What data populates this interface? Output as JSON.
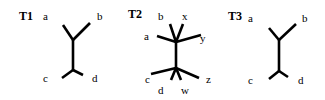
{
  "diagram": {
    "type": "phylogenetic-trees",
    "trees": [
      {
        "id": "T1",
        "title": "T1",
        "leaves": {
          "a": "a",
          "b": "b",
          "c": "c",
          "d": "d"
        },
        "topology": "((a,b),(c,d))"
      },
      {
        "id": "T2",
        "title": "T2",
        "leaves": {
          "a": "a",
          "b": "b",
          "x": "x",
          "y": "y",
          "c": "c",
          "d": "d",
          "w": "w",
          "z": "z"
        },
        "topology": "((a,b,x,y),(c,d,w,z))"
      },
      {
        "id": "T3",
        "title": "T3",
        "leaves": {
          "a": "a",
          "b": "b",
          "c": "c",
          "d": "d"
        },
        "topology": "((a,b),(c,d))"
      }
    ]
  }
}
